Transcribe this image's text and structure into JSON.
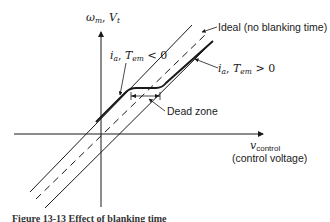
{
  "figure": {
    "y_axis_label": {
      "main": "ω",
      "sub": "m",
      "sep": ", ",
      "second": "V",
      "second_sub": "t"
    },
    "x_axis_label": {
      "main": "v",
      "sub": "control",
      "description": "(control voltage)"
    },
    "annotations": {
      "ideal": "Ideal (no blanking time)",
      "negative_current": {
        "var": "i",
        "sub": "a",
        "sep": ", ",
        "var2": "T",
        "sub2": "em",
        "rel": " < 0"
      },
      "positive_current": {
        "var": "i",
        "sub": "a",
        "sep": ", ",
        "var2": "T",
        "sub2": "em",
        "rel": " > 0"
      },
      "dead_zone": "Dead zone"
    },
    "caption": "Figure 13-13  Effect of blanking time"
  },
  "colors": {
    "ink": "#1a1a1a",
    "background": "#ffffff"
  }
}
